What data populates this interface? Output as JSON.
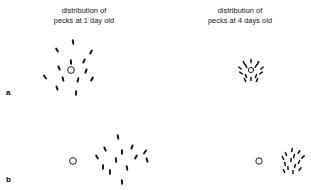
{
  "figure": {
    "width": 311,
    "height": 190,
    "background": "#ffffff",
    "ink_color": "#111111"
  },
  "captions": {
    "left": {
      "line1": "distribution of",
      "line2": "pecks at 1 day old"
    },
    "right": {
      "line1": "distribution of",
      "line2": "pecks at 4 days old"
    }
  },
  "panel_labels": {
    "a": "a",
    "b": "b"
  },
  "chart_data": {
    "type": "scatter",
    "title": "",
    "xlabel": "",
    "ylabel": "",
    "xlim": [
      0,
      311
    ],
    "ylim": [
      0,
      190
    ],
    "grid": false,
    "legend": "none",
    "annotations": [
      "distribution of pecks at 1 day old",
      "distribution of pecks at 4 days old",
      "a",
      "b"
    ],
    "marker_description": "each peck is a short dark tick (elongated dash) oriented roughly radially; the open circle marks the target stimulus centre",
    "series": [
      {
        "name": "a-1day",
        "panel": "a",
        "age_days": 1,
        "target": {
          "cx": 71,
          "cy": 70,
          "r": 3.4
        },
        "n_pecks": 13,
        "spread": "wide",
        "points": [
          {
            "x": 73,
            "y": 42,
            "angle": 100
          },
          {
            "x": 57,
            "y": 50,
            "angle": 120
          },
          {
            "x": 91,
            "y": 52,
            "angle": 60
          },
          {
            "x": 71,
            "y": 62,
            "angle": 95
          },
          {
            "x": 84,
            "y": 61,
            "angle": 65
          },
          {
            "x": 59,
            "y": 68,
            "angle": 115
          },
          {
            "x": 86,
            "y": 71,
            "angle": 70
          },
          {
            "x": 45,
            "y": 77,
            "angle": 125
          },
          {
            "x": 63,
            "y": 79,
            "angle": 105
          },
          {
            "x": 78,
            "y": 80,
            "angle": 75
          },
          {
            "x": 92,
            "y": 79,
            "angle": 60
          },
          {
            "x": 57,
            "y": 88,
            "angle": 110
          },
          {
            "x": 76,
            "y": 93,
            "angle": 85
          }
        ]
      },
      {
        "name": "a-4days",
        "panel": "a",
        "age_days": 4,
        "target": {
          "cx": 251,
          "cy": 70,
          "r": 2.6
        },
        "n_pecks": 14,
        "spread": "tight",
        "points": [
          {
            "x": 251,
            "y": 61,
            "angle": 92
          },
          {
            "x": 244,
            "y": 63,
            "angle": 118
          },
          {
            "x": 258,
            "y": 63,
            "angle": 62
          },
          {
            "x": 240,
            "y": 68,
            "angle": 140
          },
          {
            "x": 262,
            "y": 68,
            "angle": 40
          },
          {
            "x": 246,
            "y": 66,
            "angle": 120
          },
          {
            "x": 256,
            "y": 66,
            "angle": 58
          },
          {
            "x": 241,
            "y": 73,
            "angle": 145
          },
          {
            "x": 261,
            "y": 73,
            "angle": 35
          },
          {
            "x": 246,
            "y": 76,
            "angle": 110
          },
          {
            "x": 256,
            "y": 76,
            "angle": 70
          },
          {
            "x": 251,
            "y": 79,
            "angle": 90
          },
          {
            "x": 245,
            "y": 80,
            "angle": 115
          },
          {
            "x": 257,
            "y": 80,
            "angle": 65
          }
        ]
      },
      {
        "name": "b-1day",
        "panel": "b",
        "age_days": 1,
        "target": {
          "cx": 73,
          "cy": 161,
          "r": 3.4
        },
        "n_pecks": 13,
        "spread": "wide-offset",
        "points": [
          {
            "x": 118,
            "y": 137,
            "angle": 100
          },
          {
            "x": 132,
            "y": 147,
            "angle": 70
          },
          {
            "x": 105,
            "y": 149,
            "angle": 115
          },
          {
            "x": 122,
            "y": 152,
            "angle": 90
          },
          {
            "x": 145,
            "y": 152,
            "angle": 55
          },
          {
            "x": 97,
            "y": 157,
            "angle": 120
          },
          {
            "x": 116,
            "y": 160,
            "angle": 95
          },
          {
            "x": 136,
            "y": 157,
            "angle": 60
          },
          {
            "x": 147,
            "y": 160,
            "angle": 105
          },
          {
            "x": 103,
            "y": 167,
            "angle": 88
          },
          {
            "x": 127,
            "y": 168,
            "angle": 100
          },
          {
            "x": 110,
            "y": 172,
            "angle": 92
          },
          {
            "x": 122,
            "y": 182,
            "angle": 95
          }
        ]
      },
      {
        "name": "b-4days",
        "panel": "b",
        "age_days": 4,
        "target": {
          "cx": 259,
          "cy": 161,
          "r": 3.2
        },
        "n_pecks": 14,
        "spread": "tight-offset",
        "points": [
          {
            "x": 292,
            "y": 150,
            "angle": 80
          },
          {
            "x": 299,
            "y": 152,
            "angle": 55
          },
          {
            "x": 286,
            "y": 154,
            "angle": 110
          },
          {
            "x": 294,
            "y": 156,
            "angle": 75
          },
          {
            "x": 303,
            "y": 157,
            "angle": 45
          },
          {
            "x": 283,
            "y": 158,
            "angle": 120
          },
          {
            "x": 291,
            "y": 160,
            "angle": 85
          },
          {
            "x": 299,
            "y": 162,
            "angle": 60
          },
          {
            "x": 285,
            "y": 164,
            "angle": 100
          },
          {
            "x": 295,
            "y": 166,
            "angle": 70
          },
          {
            "x": 288,
            "y": 168,
            "angle": 95
          },
          {
            "x": 300,
            "y": 169,
            "angle": 50
          },
          {
            "x": 293,
            "y": 172,
            "angle": 88
          },
          {
            "x": 284,
            "y": 171,
            "angle": 115
          }
        ]
      }
    ]
  }
}
